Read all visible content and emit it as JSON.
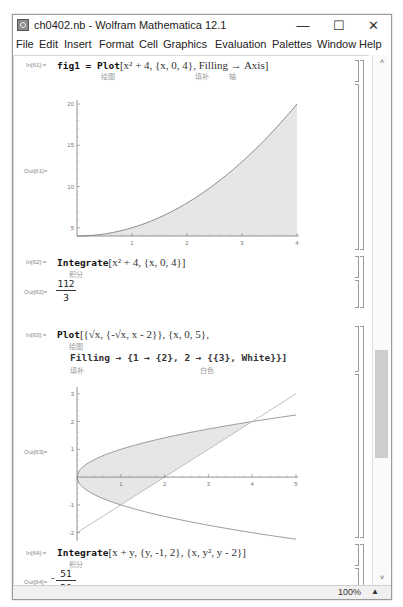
{
  "window": {
    "title": "ch0402.nb - Wolfram Mathematica 12.1",
    "minimize": "—",
    "maximize": "☐",
    "close": "✕"
  },
  "menu": [
    "File",
    "Edit",
    "Insert",
    "Format",
    "Cell",
    "Graphics",
    "Evaluation",
    "Palettes",
    "Window",
    "Help"
  ],
  "cells": [
    {
      "in_label": "In[61]:=",
      "code_prefix": "fig1 = Plot",
      "code_args": "[x² + 4, {x, 0, 4}, Filling → Axis]",
      "hints": [
        "绘图",
        "填补",
        "轴"
      ],
      "out_label": "Out[61]="
    },
    {
      "in_label": "In[62]:=",
      "code_prefix": "Integrate",
      "code_args": "[x² + 4, {x, 0, 4}]",
      "hints": [
        "积分"
      ],
      "out_label": "Out[62]=",
      "result_num": "112",
      "result_den": "3"
    },
    {
      "in_label": "In[63]:=",
      "code_prefix": "Plot",
      "code_args": "[{√x, {-√x, x - 2}}, {x, 0, 5},",
      "code_line2": "Filling → {1 → {2}, 2 → {{3}, White}}]",
      "hints": [
        "绘图",
        "填补",
        "白色"
      ],
      "out_label": "Out[63]="
    },
    {
      "in_label": "In[64]:=",
      "code_prefix": "Integrate",
      "code_args": "[x + y, {y, -1, 2}, {x, y², y - 2}]",
      "hints": [
        "积分"
      ],
      "out_label": "Out[64]=",
      "result_sign": "-",
      "result_num": "51",
      "result_den": "20"
    }
  ],
  "status": {
    "zoom": "100%",
    "zoom_arrow": "▲"
  },
  "scroll": {
    "up": "˄",
    "down": "˅"
  },
  "chart_data": [
    {
      "type": "area",
      "title": "",
      "function": "x^2 + 4",
      "filling": "Axis",
      "xlim": [
        0,
        4
      ],
      "ylim": [
        4,
        20
      ],
      "x_ticks": [
        "1",
        "2",
        "3",
        "4"
      ],
      "y_ticks": [
        "5",
        "10",
        "15",
        "20"
      ],
      "x_tick_values": [
        1,
        2,
        3,
        4
      ],
      "y_tick_values": [
        5,
        10,
        15,
        20
      ],
      "axis_origin_y": 4
    },
    {
      "type": "line",
      "title": "",
      "series": [
        {
          "name": "sqrt(x)",
          "function": "Sqrt[x]"
        },
        {
          "name": "-sqrt(x)",
          "function": "-Sqrt[x]"
        },
        {
          "name": "x-2",
          "function": "x - 2"
        }
      ],
      "filling": "1 → {2}, 2 → {{3}, White}",
      "xlim": [
        0,
        5
      ],
      "ylim": [
        -2.3,
        3.1
      ],
      "x_ticks": [
        "1",
        "2",
        "3",
        "4",
        "5"
      ],
      "y_ticks": [
        "-2",
        "-1",
        "1",
        "2",
        "3"
      ],
      "x_tick_values": [
        1,
        2,
        3,
        4,
        5
      ],
      "y_tick_values": [
        -2,
        -1,
        1,
        2,
        3
      ]
    }
  ]
}
